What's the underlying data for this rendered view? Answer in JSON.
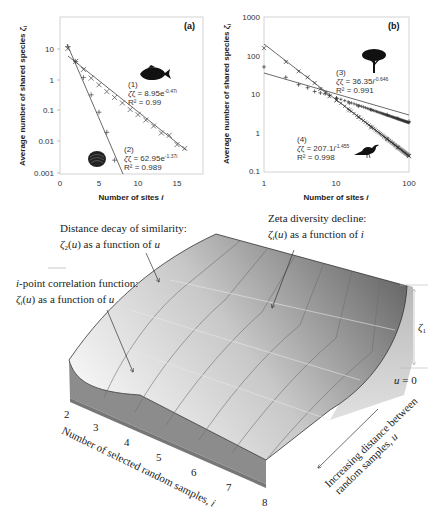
{
  "chart_data": [
    {
      "type": "scatter",
      "panel_label": "(a)",
      "title": "",
      "xlabel": "Number of sites i",
      "ylabel": "Average number of shared species ζi",
      "xscale": "linear",
      "yscale": "log",
      "xlim": [
        0,
        18
      ],
      "ylim": [
        0.001,
        100
      ],
      "xticks": [
        "0",
        "5",
        "10",
        "15"
      ],
      "yticks": [
        "0.001",
        "0.01",
        "0.1",
        "1",
        "10"
      ],
      "grid": false,
      "series": [
        {
          "name": "(1) fish",
          "marker": "x",
          "fit": "exponential",
          "equation": "ζ = 8.95e^(-0.47i)",
          "equation_label": "ζ = 8.95e",
          "equation_exp": "-0.47i",
          "r2": "R² = 0.99",
          "x": [
            1,
            2,
            3,
            4,
            5,
            6,
            7,
            8,
            9,
            10,
            11,
            12,
            13,
            14,
            15,
            16
          ],
          "values": [
            10.5,
            4.0,
            2.2,
            1.15,
            0.7,
            0.42,
            0.27,
            0.18,
            0.11,
            0.075,
            0.05,
            0.032,
            0.019,
            0.016,
            0.008,
            0.006
          ]
        },
        {
          "name": "(2) shell",
          "marker": "+",
          "fit": "exponential",
          "equation": "ζ = 62.95e^(-1.37i)",
          "equation_label": "ζ = 62.95e",
          "equation_exp": "-1.37i",
          "r2": "R² = 0.989",
          "x": [
            1,
            2,
            3,
            4,
            5,
            6,
            7
          ],
          "values": [
            12.0,
            4.0,
            1.2,
            0.33,
            0.09,
            0.02,
            0.0025
          ]
        }
      ]
    },
    {
      "type": "scatter",
      "panel_label": "(b)",
      "title": "",
      "xlabel": "Number of sites i",
      "ylabel": "Average number of shared species ζi",
      "xscale": "log",
      "yscale": "log",
      "xlim": [
        1,
        100
      ],
      "ylim": [
        0.1,
        1000
      ],
      "xticks": [
        "1",
        "10",
        "100"
      ],
      "yticks": [
        "0.1",
        "1",
        "10",
        "100",
        "1000"
      ],
      "grid": false,
      "series": [
        {
          "name": "(3) tree",
          "marker": "+",
          "fit": "power",
          "equation": "ζ = 36.35i^(-0.646)",
          "equation_label": "ζ = 36.35",
          "equation_exp": "-0.646",
          "r2": "R² = 0.991",
          "x": [
            1,
            2,
            3,
            4,
            5,
            6,
            7,
            8,
            10,
            15,
            20,
            30,
            50,
            70,
            100
          ],
          "values": [
            52,
            28,
            18,
            15,
            12,
            11,
            10.5,
            9.5,
            8,
            6,
            5,
            4,
            3,
            2.4,
            2.0
          ]
        },
        {
          "name": "(4) bird",
          "marker": "x",
          "fit": "power",
          "equation": "ζ = 207.1i^(-1.455)",
          "equation_label": "ζ = 207.1",
          "equation_exp": "-1.455",
          "r2": "R² = 0.998",
          "x": [
            1,
            2,
            3,
            4,
            5,
            6,
            7,
            8,
            10,
            15,
            20,
            30,
            50,
            70,
            100
          ],
          "values": [
            160,
            70,
            40,
            28,
            20,
            14,
            11,
            9,
            7,
            3.9,
            2.6,
            1.4,
            0.7,
            0.42,
            0.25
          ]
        }
      ]
    },
    {
      "type": "surface",
      "title": "",
      "xlabel": "Number of selected random samples, i",
      "ylabel": "Increasing distance between random samples, u",
      "zlabel": "ζ1",
      "xticks": [
        "2",
        "3",
        "4",
        "5",
        "6",
        "7",
        "8"
      ],
      "u_origin_label": "u = 0",
      "annotations": [
        {
          "title": "Distance decay of similarity:",
          "sub_main": "ζ",
          "sub_idx": "2",
          "sub_rest": "(u) as a function of ",
          "sub_var": "u"
        },
        {
          "title": "Zeta diversity decline:",
          "sub_main": "ζ",
          "sub_idx": "i",
          "sub_rest": "(u) as a function of ",
          "sub_var": "i"
        },
        {
          "title": "i-point correlation function:",
          "sub_main": "ζ",
          "sub_idx": "i",
          "sub_rest": "(u) as a function of ",
          "sub_var": "u"
        }
      ]
    }
  ],
  "icons": {
    "fish": "fish-silhouette-icon",
    "shell": "shell-silhouette-icon",
    "tree": "tree-silhouette-icon",
    "bird": "bird-silhouette-icon"
  },
  "labels": {
    "a_eq1_num": "(1)",
    "a_eq2_num": "(2)",
    "b_eq3_num": "(3)",
    "b_eq4_num": "(4)",
    "b_exp_var": "i",
    "axis_x_a_main": "Number of sites ",
    "axis_x_var": "i",
    "axis_y_main": "Average number of shared species ",
    "axis_y_var": "ζ",
    "axis_y_sub": "i",
    "surface_i_label_main": "Number of selected random samples, ",
    "surface_i_var": "i",
    "surface_u_line1": "Increasing distance between",
    "surface_u_line2_main": "random samples, ",
    "surface_u_var": "u",
    "zeta1_main": "ζ",
    "zeta1_sub": "1",
    "u_zero_var": "u",
    "u_zero_rest": " = 0",
    "i_point_prefix": "i",
    "i_point_rest": "-point correlation function:"
  },
  "colors": {
    "axis": "#bfbfbf",
    "data": "#333333",
    "fit": "#444444",
    "surface_dark": "#5a5a5a",
    "surface_light": "#f2f2f2",
    "side_face": "#8a8a8a"
  }
}
